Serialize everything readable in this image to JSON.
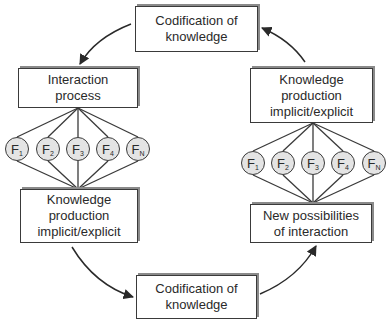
{
  "diagram": {
    "type": "cycle",
    "boxes": {
      "top": {
        "lines": [
          "Codification of",
          "knowledge"
        ]
      },
      "left_upper": {
        "lines": [
          "Interaction",
          "process"
        ]
      },
      "left_lower": {
        "lines": [
          "Knowledge",
          "production",
          "implicit/explicit"
        ]
      },
      "bottom": {
        "lines": [
          "Codification of",
          "knowledge"
        ]
      },
      "right_lower": {
        "lines": [
          "New possibilities",
          "of interaction"
        ]
      },
      "right_upper": {
        "lines": [
          "Knowledge",
          "production",
          "implicit/explicit"
        ]
      }
    },
    "left_nodes": [
      {
        "letter": "F",
        "sub": "1"
      },
      {
        "letter": "F",
        "sub": "2"
      },
      {
        "letter": "F",
        "sub": "3"
      },
      {
        "letter": "F",
        "sub": "4"
      },
      {
        "letter": "F",
        "sub": "N"
      }
    ],
    "right_nodes": [
      {
        "letter": "F",
        "sub": "1"
      },
      {
        "letter": "F",
        "sub": "2"
      },
      {
        "letter": "F",
        "sub": "3"
      },
      {
        "letter": "F",
        "sub": "4"
      },
      {
        "letter": "F",
        "sub": "N"
      }
    ],
    "flow": [
      "Codification of knowledge (top) -> Interaction process",
      "Interaction process -> F1..FN -> Knowledge production implicit/explicit",
      "Knowledge production implicit/explicit -> Codification of knowledge (bottom)",
      "Codification of knowledge (bottom) -> New possibilities of interaction",
      "New possibilities of interaction -> F1..FN -> Knowledge production implicit/explicit",
      "Knowledge production implicit/explicit -> Codification of knowledge (top)"
    ],
    "colors": {
      "stroke": "#3a3a3a",
      "node_fill": "#e4e4e4",
      "shadow": "#8a8a8a",
      "text": "#2a2a2a"
    }
  }
}
